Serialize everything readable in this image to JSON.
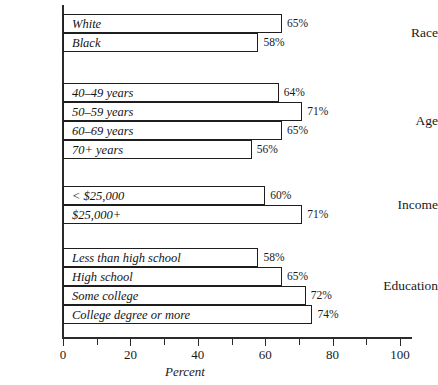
{
  "chart_data": {
    "type": "bar",
    "orientation": "horizontal",
    "title": "",
    "xlabel": "Percent",
    "ylabel": "",
    "xlim": [
      0,
      100
    ],
    "xticks": [
      0,
      20,
      40,
      60,
      80,
      100
    ],
    "xtick_labels": [
      "0",
      "20",
      "40",
      "60",
      "80",
      "100"
    ],
    "minor_ticks": [
      10,
      30,
      50,
      70,
      90
    ],
    "grid": false,
    "legend": false,
    "value_suffix": "%",
    "groups": [
      {
        "label": "Race",
        "categories": [
          "White",
          "Black"
        ],
        "values": [
          65,
          58
        ],
        "value_labels": [
          "65%",
          "58%"
        ]
      },
      {
        "label": "Age",
        "categories": [
          "40–49 years",
          "50–59 years",
          "60–69 years",
          "70+ years"
        ],
        "values": [
          64,
          71,
          65,
          56
        ],
        "value_labels": [
          "64%",
          "71%",
          "65%",
          "56%"
        ]
      },
      {
        "label": "Income",
        "categories": [
          "< $25,000",
          "$25,000+"
        ],
        "values": [
          60,
          71
        ],
        "value_labels": [
          "60%",
          "71%"
        ]
      },
      {
        "label": "Education",
        "categories": [
          "Less than high school",
          "High school",
          "Some college",
          "College degree or more"
        ],
        "values": [
          58,
          65,
          72,
          74
        ],
        "value_labels": [
          "58%",
          "65%",
          "72%",
          "74%"
        ]
      }
    ],
    "categories": [
      "White",
      "Black",
      "40–49 years",
      "50–59 years",
      "60–69 years",
      "70+ years",
      "< $25,000",
      "$25,000+",
      "Less than high school",
      "High school",
      "Some college",
      "College degree or more"
    ],
    "values": [
      65,
      58,
      64,
      71,
      65,
      56,
      60,
      71,
      58,
      65,
      72,
      74
    ]
  },
  "colors": {
    "bar_fill": "#ffffff",
    "bar_stroke": "#1e1e1e",
    "axis": "#2b2b2b",
    "text": "#1a1a1a",
    "background": "#ffffff"
  }
}
